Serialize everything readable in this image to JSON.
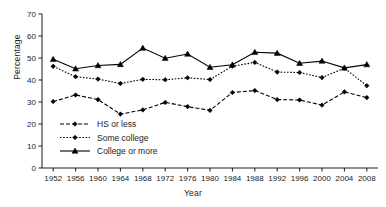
{
  "chart_data": {
    "type": "line",
    "title": "",
    "xlabel": "Year",
    "ylabel": "Percentage",
    "x": [
      1952,
      1956,
      1960,
      1964,
      1968,
      1972,
      1976,
      1980,
      1984,
      1988,
      1992,
      1996,
      2000,
      2004,
      2008
    ],
    "xtick_labels": [
      "1952",
      "1956",
      "1960",
      "1964",
      "1968",
      "1972",
      "1976",
      "1980",
      "1984",
      "1988",
      "1992",
      "1996",
      "2000",
      "2004",
      "2008"
    ],
    "ytick_labels": [
      "0",
      "10",
      "20",
      "30",
      "40",
      "50",
      "60",
      "70"
    ],
    "yticks": [
      0,
      10,
      20,
      30,
      40,
      50,
      60,
      70
    ],
    "ylim": [
      0,
      70
    ],
    "xlim": [
      1950,
      2010
    ],
    "grid": false,
    "legend_position": "lower-left-inside",
    "series": [
      {
        "name": "HS or less",
        "marker": "diamond",
        "dash": "4,2",
        "values": [
          30.2,
          33.2,
          31.1,
          24.5,
          26.4,
          29.8,
          27.9,
          26.2,
          34.3,
          35.2,
          31.1,
          30.9,
          28.6,
          34.6,
          32.0
        ]
      },
      {
        "name": "Some college",
        "marker": "diamond",
        "dash": "1.6,1.6",
        "values": [
          46.2,
          41.5,
          40.4,
          38.4,
          40.3,
          40.1,
          41.0,
          40.2,
          46.3,
          48.0,
          43.6,
          43.4,
          41.1,
          45.4,
          37.4
        ]
      },
      {
        "name": "College or more",
        "marker": "triangle",
        "dash": "none",
        "values": [
          49.4,
          45.1,
          46.6,
          47.1,
          54.5,
          49.9,
          51.8,
          45.8,
          46.9,
          52.6,
          52.2,
          47.6,
          48.6,
          45.5,
          47.0
        ]
      }
    ]
  },
  "legend": {
    "items": [
      {
        "label": "HS or less"
      },
      {
        "label": "Some college"
      },
      {
        "label": "College or more"
      }
    ]
  }
}
